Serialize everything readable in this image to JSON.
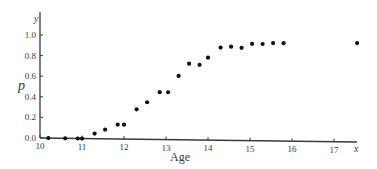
{
  "chart_data": {
    "type": "scatter",
    "title": "",
    "xlabel": "Age",
    "ylabel": "p",
    "x_axis_var": "x",
    "y_axis_var": "y",
    "xlim": [
      10,
      17.7
    ],
    "ylim": [
      0.0,
      1.05
    ],
    "xticks": [
      10,
      11,
      12,
      13,
      14,
      15,
      16,
      17
    ],
    "xtick_labels": [
      "10",
      "11",
      "12",
      "13",
      "14",
      "15",
      "16",
      "17"
    ],
    "yticks": [
      0.0,
      0.2,
      0.4,
      0.6,
      0.8,
      1.0
    ],
    "ytick_labels": [
      "0.0",
      "0.2",
      "0.4",
      "0.6",
      "0.8",
      "1.0"
    ],
    "grid": false,
    "legend": null,
    "series": [
      {
        "name": "p",
        "x": [
          10.2,
          10.6,
          10.9,
          11.0,
          11.3,
          11.55,
          11.85,
          12.0,
          12.3,
          12.55,
          12.85,
          13.05,
          13.3,
          13.55,
          13.8,
          14.0,
          14.3,
          14.55,
          14.8,
          15.05,
          15.3,
          15.55,
          15.8,
          17.55
        ],
        "y": [
          0.0,
          0.0,
          0.0,
          0.0,
          0.05,
          0.09,
          0.14,
          0.14,
          0.29,
          0.36,
          0.46,
          0.46,
          0.62,
          0.74,
          0.73,
          0.8,
          0.9,
          0.91,
          0.9,
          0.94,
          0.94,
          0.95,
          0.95,
          0.96
        ]
      }
    ]
  },
  "colors": {
    "axis": "#3a3a3a",
    "points": "#111111",
    "background": "#ffffff"
  }
}
